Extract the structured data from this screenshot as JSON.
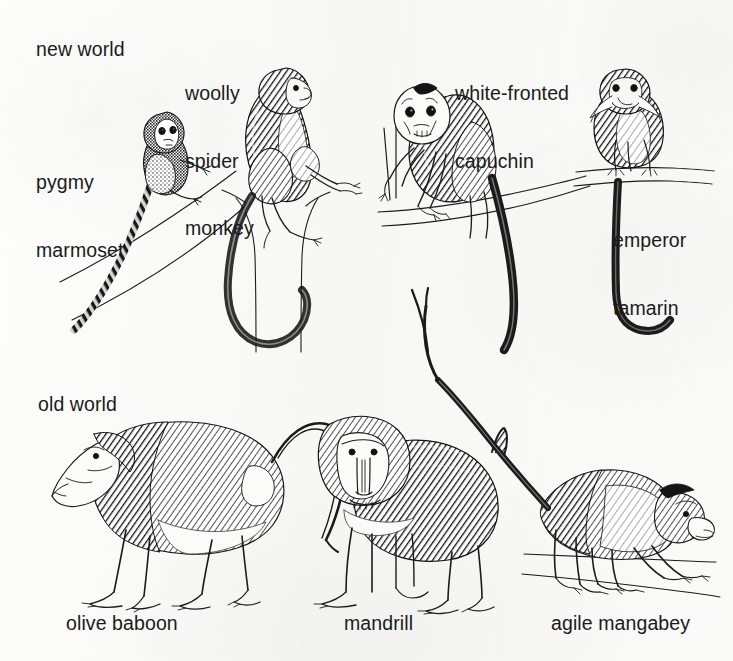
{
  "figure": {
    "background_color": "#fbfbf9",
    "ink_color": "#1b1b1b",
    "width": 733,
    "height": 661
  },
  "groups": [
    {
      "id": "new-world",
      "label": "new world"
    },
    {
      "id": "old-world",
      "label": "old world"
    }
  ],
  "labels": {
    "new_world": "new world",
    "old_world": "old world",
    "pygmy_marmoset_line1": "pygmy",
    "pygmy_marmoset_line2": "marmoset",
    "woolly_spider_monkey_line1": "woolly",
    "woolly_spider_monkey_line2": "spider",
    "woolly_spider_monkey_line3": "monkey",
    "white_fronted_capuchin_line1": "white-fronted",
    "white_fronted_capuchin_line2": "capuchin",
    "emperor_tamarin_line1": "emperor",
    "emperor_tamarin_line2": "tamarin",
    "olive_baboon": "olive baboon",
    "mandrill": "mandrill",
    "agile_mangabey": "agile mangabey"
  },
  "specimens": [
    {
      "id": "pygmy-marmoset",
      "name": "pygmy marmoset",
      "group": "new world",
      "pose": "clinging to diagonal branch, long banded tail"
    },
    {
      "id": "woolly-spider-monkey",
      "name": "woolly spider monkey",
      "group": "new world",
      "pose": "seated atop vertical trunk, long curling prehensile tail"
    },
    {
      "id": "white-fronted-capuchin",
      "name": "white-fronted capuchin",
      "group": "new world",
      "pose": "standing on branch gripping stem, pale face, long tail"
    },
    {
      "id": "emperor-tamarin",
      "name": "emperor tamarin",
      "group": "new world",
      "pose": "sitting on branch, white moustache, long tail hanging down"
    },
    {
      "id": "olive-baboon",
      "name": "olive baboon",
      "group": "old world",
      "pose": "walking in profile, dog-like muzzle, arched tail"
    },
    {
      "id": "mandrill",
      "name": "mandrill",
      "group": "old world",
      "pose": "facing forward, ridged snout and mane, short upright tail"
    },
    {
      "id": "agile-mangabey",
      "name": "agile mangabey",
      "group": "old world",
      "pose": "walking on ground, head lowered, long raised tail"
    }
  ]
}
